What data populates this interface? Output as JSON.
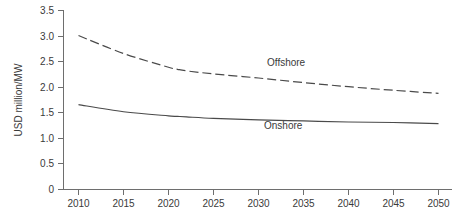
{
  "chart_data": {
    "type": "line",
    "title": "",
    "subtitle": "",
    "xlabel": "",
    "ylabel": "USD million/MW",
    "xlim": [
      2010,
      2050
    ],
    "ylim": [
      0,
      3.5
    ],
    "grid": false,
    "legend_position": "inline-annotation",
    "x": [
      2010,
      2015,
      2020,
      2021,
      2022,
      2025,
      2030,
      2035,
      2040,
      2045,
      2050
    ],
    "xticks": [
      "2010",
      "2015",
      "2020",
      "2025",
      "2030",
      "2035",
      "2040",
      "2045",
      "2050"
    ],
    "yticks": [
      "0",
      "0.5",
      "1.0",
      "1.5",
      "2.0",
      "2.5",
      "3.0",
      "3.5"
    ],
    "ytick_values": [
      0,
      0.5,
      1.0,
      1.5,
      2.0,
      2.5,
      3.0,
      3.5
    ],
    "series": [
      {
        "name": "Offshore",
        "style": "dashed",
        "color": "#4a4a4a",
        "label_text": "Offshore",
        "values": [
          3.01,
          2.66,
          2.39,
          2.35,
          2.32,
          2.26,
          2.18,
          2.09,
          2.01,
          1.94,
          1.88
        ]
      },
      {
        "name": "Onshore",
        "style": "solid",
        "color": "#4a4a4a",
        "label_text": "Onshore",
        "values": [
          1.66,
          1.52,
          1.44,
          1.43,
          1.42,
          1.39,
          1.36,
          1.34,
          1.32,
          1.31,
          1.29
        ]
      }
    ],
    "annotations": [
      {
        "text": "Offshore",
        "x": 2032,
        "y": 2.45
      },
      {
        "text": "Onshore",
        "x": 2031,
        "y": 1.28
      }
    ]
  },
  "axes": {
    "y_axis_title": "USD million/MW"
  }
}
